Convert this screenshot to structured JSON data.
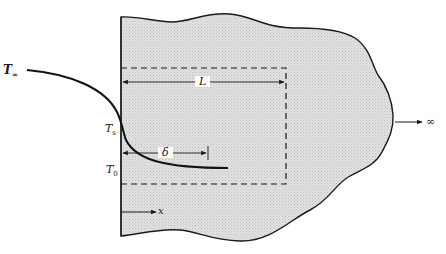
{
  "figure": {
    "type": "heat-conduction semi-infinite solid schematic",
    "labels": {
      "t_infinity": {
        "base": "T",
        "sub": "∞"
      },
      "t_s": {
        "base": "T",
        "sub": "s"
      },
      "t_0": {
        "base": "T",
        "sub": "0"
      },
      "length": "L",
      "delta": "δ",
      "x_axis": "x",
      "infinity": "∞"
    },
    "colors": {
      "fill": "#dcdcdc",
      "stroke": "#1a1a1a",
      "background": "#ffffff"
    }
  }
}
